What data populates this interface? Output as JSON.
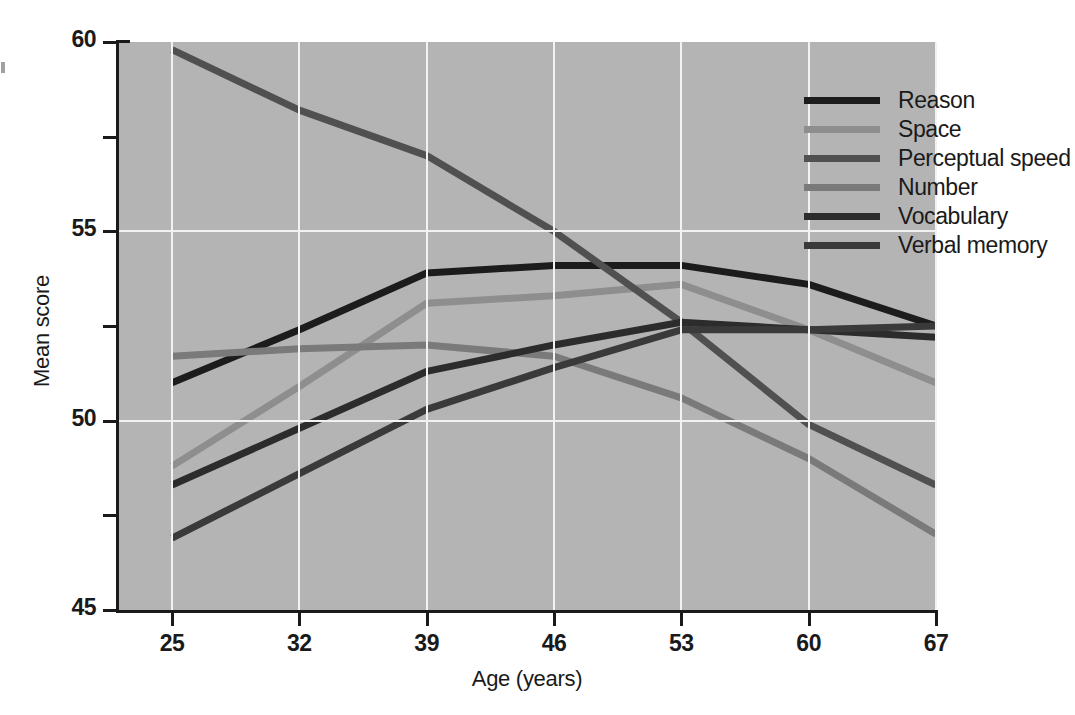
{
  "chart_data": {
    "type": "line",
    "title": "",
    "xlabel": "Age (years)",
    "ylabel": "Mean score",
    "x": [
      25,
      32,
      39,
      46,
      53,
      60,
      67
    ],
    "xlim": [
      25,
      67
    ],
    "ylim": [
      45,
      60
    ],
    "xticks": [
      "25",
      "32",
      "39",
      "46",
      "53",
      "60",
      "67"
    ],
    "yticks": [
      "45",
      "50",
      "55",
      "60"
    ],
    "yminorticks": [
      47.5,
      52.5,
      57.5
    ],
    "grid": "white gridlines at major x and y ticks",
    "legend_position": "top-right inside plot area",
    "plot_background": "#b4b4b4",
    "gridline_color": "#f2f2f2",
    "series": [
      {
        "name": "Reason",
        "color": "#1c1c1c",
        "values": [
          51.0,
          52.4,
          53.9,
          54.1,
          54.1,
          53.6,
          52.5
        ]
      },
      {
        "name": "Space",
        "color": "#8e8e8e",
        "values": [
          48.8,
          50.9,
          53.1,
          53.3,
          53.6,
          52.4,
          51.0
        ]
      },
      {
        "name": "Perceptual speed",
        "color": "#505050",
        "values": [
          59.8,
          58.2,
          57.0,
          55.0,
          52.6,
          49.9,
          48.3
        ]
      },
      {
        "name": "Number",
        "color": "#7a7a7a",
        "values": [
          51.7,
          51.9,
          52.0,
          51.7,
          50.6,
          49.0,
          47.0
        ]
      },
      {
        "name": "Vocabulary",
        "color": "#2c2c2c",
        "values": [
          48.3,
          49.8,
          51.3,
          52.0,
          52.6,
          52.4,
          52.2
        ]
      },
      {
        "name": "Verbal memory",
        "color": "#3a3a3a",
        "values": [
          46.9,
          48.6,
          50.3,
          51.4,
          52.4,
          52.4,
          52.5
        ]
      }
    ]
  },
  "axes": {
    "x_title": "Age (years)",
    "y_title": "Mean score"
  }
}
